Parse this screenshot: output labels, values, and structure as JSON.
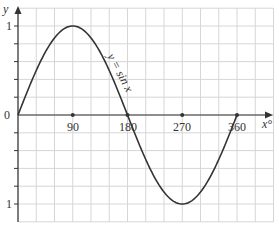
{
  "chart_data": {
    "type": "line",
    "title": "",
    "xlabel": "x°",
    "ylabel": "y",
    "curve_label": "y = sin x",
    "x": [
      0,
      30,
      60,
      90,
      120,
      150,
      180,
      210,
      240,
      270,
      300,
      330,
      360
    ],
    "series": [
      {
        "name": "y = sin x",
        "values": [
          0,
          0.5,
          0.866,
          1,
          0.866,
          0.5,
          0,
          -0.5,
          -0.866,
          -1,
          -0.866,
          -0.5,
          0
        ]
      }
    ],
    "marked_points": [
      [
        90,
        0
      ],
      [
        180,
        0
      ],
      [
        270,
        0
      ],
      [
        360,
        0
      ]
    ],
    "x_ticks": [
      "90",
      "180",
      "270",
      "360"
    ],
    "y_ticks": [
      "1",
      "0",
      "1"
    ],
    "xlim": [
      0,
      420
    ],
    "ylim": [
      -1.2,
      1.2
    ],
    "grid": true,
    "grid_x_step": 30,
    "grid_y_step": 0.2,
    "colors": {
      "curve": "#333333",
      "grid": "#d8d8d8",
      "axis": "#333333"
    }
  },
  "labels": {
    "y_axis": "y",
    "x_axis": "x°",
    "origin": "0",
    "y_top": "1",
    "y_bottom": "1",
    "x90": "90",
    "x180": "180",
    "x270": "270",
    "x360": "360",
    "curve": "y = sin x"
  }
}
